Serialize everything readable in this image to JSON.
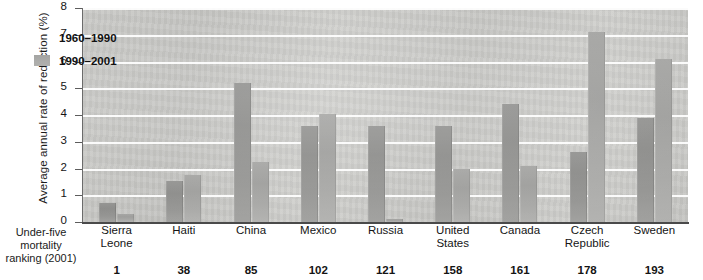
{
  "chart_data": {
    "type": "bar",
    "title": "",
    "xlabel": "Under-five mortality ranking (2001)",
    "ylabel": "Average annual rate of reduction (%)",
    "ylim": [
      0,
      8
    ],
    "ytick_labels": [
      "0",
      "1",
      "2",
      "3",
      "4",
      "5",
      "6",
      "7",
      "8"
    ],
    "ytick_values": [
      0,
      1,
      2,
      3,
      4,
      5,
      6,
      7,
      8
    ],
    "grid": true,
    "legend_position": "top-left-inside",
    "categories": [
      "Sierra\nLeone",
      "Haiti",
      "China",
      "Mexico",
      "Russia",
      "United\nStates",
      "Canada",
      "Czech\nRepublic",
      "Sweden"
    ],
    "category_sublabels": [
      "1",
      "38",
      "85",
      "102",
      "121",
      "158",
      "161",
      "178",
      "193"
    ],
    "series": [
      {
        "name": "1960–1990",
        "color": "#949492",
        "values": [
          0.7,
          1.55,
          5.2,
          3.6,
          3.6,
          3.6,
          4.4,
          2.6,
          3.9
        ]
      },
      {
        "name": "1990–2001",
        "color": "#a6a6a4",
        "values": [
          0.3,
          1.75,
          2.25,
          4.05,
          0.1,
          2.0,
          2.1,
          7.1,
          6.1
        ]
      }
    ]
  },
  "axis": {
    "corner_label": "Under-five\nmortality\nranking\n(2001)"
  },
  "legend": {
    "items": [
      {
        "label": "1960–1990",
        "swatch": "series-1-swatch"
      },
      {
        "label": "1990–2001",
        "swatch": "series-2-swatch"
      }
    ]
  }
}
